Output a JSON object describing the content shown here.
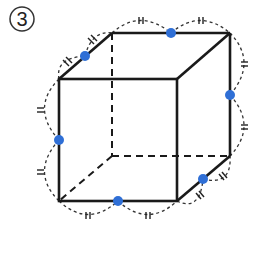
{
  "figure": {
    "label": "3",
    "colors": {
      "edge": "#1a1a1a",
      "hidden_edge": "#1a1a1a",
      "midpoint": "#2f6fd6",
      "arc": "#333333"
    },
    "vertices": {
      "front_top_left": [
        59,
        79
      ],
      "front_top_right": [
        177,
        79
      ],
      "front_bottom_left": [
        59,
        201
      ],
      "front_bottom_right": [
        177,
        201
      ],
      "back_top_left": [
        112,
        33
      ],
      "back_top_right": [
        230,
        33
      ],
      "back_bottom_left": [
        112,
        156
      ],
      "back_bottom_right": [
        230,
        156
      ]
    },
    "midpoints": [
      {
        "name": "mid-top-left-edge",
        "pos": [
          85,
          56
        ]
      },
      {
        "name": "mid-back-top-edge",
        "pos": [
          171,
          33
        ]
      },
      {
        "name": "mid-back-right-edge",
        "pos": [
          230,
          95
        ]
      },
      {
        "name": "mid-front-left-edge",
        "pos": [
          59,
          140
        ]
      },
      {
        "name": "mid-front-bottom-edge",
        "pos": [
          118,
          201
        ]
      },
      {
        "name": "mid-bottom-right-edge",
        "pos": [
          203,
          179
        ]
      }
    ],
    "tick_mark": "double"
  }
}
